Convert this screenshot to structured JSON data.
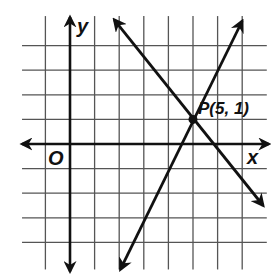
{
  "diagram": {
    "type": "coordinate-plane",
    "x_axis_label": "x",
    "y_axis_label": "y",
    "origin_label": "O",
    "grid": {
      "x_lines": [
        -1,
        0,
        1,
        2,
        3,
        4,
        5,
        6,
        7
      ],
      "y_lines": [
        -4,
        -3,
        -2,
        -1,
        0,
        1,
        2,
        3,
        4
      ],
      "x_extent": [
        -1.95,
        8.0
      ],
      "y_extent": [
        -5.1,
        5.2
      ]
    },
    "lines": [
      {
        "name": "rising-line",
        "slope": 2,
        "intercept": -9,
        "from": [
          2.05,
          -5.1
        ],
        "to": [
          7.0,
          5.0
        ]
      },
      {
        "name": "falling-line",
        "slope": -1.3333,
        "intercept": 7.6667,
        "from": [
          1.8,
          5.05
        ],
        "to": [
          7.85,
          -2.5
        ]
      }
    ],
    "point": {
      "label": "P(5, 1)",
      "x": 5,
      "y": 1
    },
    "colors": {
      "ink": "#111111",
      "grid": "#555555",
      "background": "#ffffff"
    }
  }
}
